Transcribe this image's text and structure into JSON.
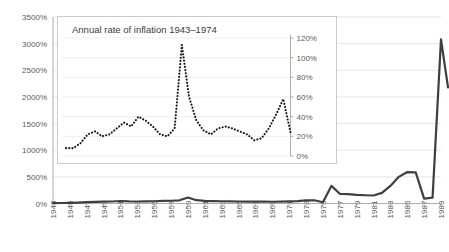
{
  "chart_data": [
    {
      "id": "main",
      "type": "line",
      "title": "",
      "xlabel": "",
      "ylabel": "",
      "ylim": [
        0,
        3500
      ],
      "xlim": [
        1943,
        1989
      ],
      "grid": true,
      "legend": "none",
      "ytick_labels": [
        "0%",
        "500%",
        "1000%",
        "1500%",
        "2000%",
        "2500%",
        "3000%",
        "3500%"
      ],
      "ytick_values": [
        0,
        500,
        1000,
        1500,
        2000,
        2500,
        3000,
        3500
      ],
      "xtick_labels": [
        "1943",
        "1945",
        "1947",
        "1949",
        "1951",
        "1953",
        "1955",
        "1957",
        "1959",
        "1961",
        "1963",
        "1965",
        "1967",
        "1969",
        "1971",
        "1973",
        "1975",
        "1977",
        "1979",
        "1981",
        "1983",
        "1985",
        "1987",
        "1989"
      ],
      "x": [
        1943,
        1944,
        1945,
        1946,
        1947,
        1948,
        1949,
        1950,
        1951,
        1952,
        1953,
        1954,
        1955,
        1956,
        1957,
        1958,
        1959,
        1960,
        1961,
        1962,
        1963,
        1964,
        1965,
        1966,
        1967,
        1968,
        1969,
        1970,
        1971,
        1972,
        1973,
        1974,
        1975,
        1976,
        1977,
        1978,
        1979,
        1980,
        1981,
        1982,
        1983,
        1984,
        1985,
        1986,
        1987,
        1988,
        1989
      ],
      "values": [
        8,
        9,
        13,
        18,
        25,
        30,
        36,
        38,
        47,
        40,
        38,
        40,
        42,
        48,
        52,
        60,
        113,
        62,
        50,
        45,
        42,
        40,
        38,
        36,
        34,
        34,
        33,
        35,
        40,
        45,
        58,
        60,
        24,
        330,
        182,
        175,
        160,
        155,
        150,
        200,
        330,
        500,
        590,
        585,
        90,
        110,
        3080
      ],
      "end_value": 2180,
      "series_color": "#3f3f3f",
      "note": "Final segment descends from the 1989 peak to about 2180%"
    },
    {
      "id": "inset",
      "type": "line",
      "title": "Annual rate of inflation 1943–1974",
      "xlabel": "",
      "ylabel": "",
      "ylim": [
        0,
        120
      ],
      "xlim": [
        1943,
        1974
      ],
      "grid": true,
      "legend": "none",
      "style": "dotted",
      "ytick_labels": [
        "0%",
        "20%",
        "40%",
        "60%",
        "80%",
        "100%",
        "120%"
      ],
      "ytick_values": [
        0,
        20,
        40,
        60,
        80,
        100,
        120
      ],
      "x": [
        1943,
        1944,
        1945,
        1946,
        1947,
        1948,
        1949,
        1950,
        1951,
        1952,
        1953,
        1954,
        1955,
        1956,
        1957,
        1958,
        1959,
        1960,
        1961,
        1962,
        1963,
        1964,
        1965,
        1966,
        1967,
        1968,
        1969,
        1970,
        1971,
        1972,
        1973,
        1974
      ],
      "values": [
        8,
        8,
        13,
        22,
        25,
        20,
        22,
        28,
        34,
        30,
        40,
        36,
        30,
        22,
        20,
        28,
        113,
        60,
        36,
        26,
        22,
        28,
        30,
        28,
        25,
        22,
        16,
        18,
        28,
        42,
        58,
        24
      ],
      "series_color": "#1a1a1a"
    }
  ],
  "main_chart": {
    "ytick_labels": [
      "3500%",
      "3000%",
      "2500%",
      "2000%",
      "1500%",
      "1000%",
      "500%",
      "0%"
    ],
    "xtick_labels": [
      "1943",
      "1945",
      "1947",
      "1949",
      "1951",
      "1953",
      "1955",
      "1957",
      "1959",
      "1961",
      "1963",
      "1965",
      "1967",
      "1969",
      "1971",
      "1973",
      "1975",
      "1977",
      "1979",
      "1981",
      "1983",
      "1985",
      "1987",
      "1989"
    ]
  },
  "inset_chart": {
    "title": "Annual rate of inflation 1943–1974",
    "ytick_labels": [
      "120%",
      "100%",
      "80%",
      "60%",
      "40%",
      "20%",
      "0%"
    ]
  },
  "colors": {
    "background": "#ffffff",
    "gridline": "#d9d9d9",
    "axis": "#9a9a9a",
    "main_series": "#3f3f3f",
    "inset_series": "#1a1a1a",
    "text": "#595959",
    "inset_border": "#c6c6c6"
  }
}
